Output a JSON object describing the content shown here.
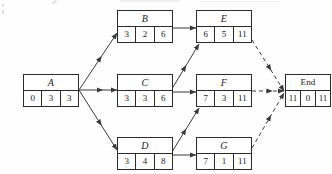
{
  "diagram": {
    "nodes": [
      {
        "id": "A",
        "label": "A",
        "cells": [
          "0",
          "3",
          "3"
        ],
        "x": 23,
        "y": 74,
        "w": 56,
        "h": 33
      },
      {
        "id": "B",
        "label": "B",
        "cells": [
          "3",
          "2",
          "6"
        ],
        "x": 117,
        "y": 10,
        "w": 56,
        "h": 33
      },
      {
        "id": "C",
        "label": "C",
        "cells": [
          "3",
          "3",
          "6"
        ],
        "x": 117,
        "y": 74,
        "w": 56,
        "h": 33
      },
      {
        "id": "D",
        "label": "D",
        "cells": [
          "3",
          "4",
          "8"
        ],
        "x": 117,
        "y": 137,
        "w": 56,
        "h": 33
      },
      {
        "id": "E",
        "label": "E",
        "cells": [
          "6",
          "5",
          "11"
        ],
        "x": 196,
        "y": 10,
        "w": 56,
        "h": 33
      },
      {
        "id": "F",
        "label": "F",
        "cells": [
          "7",
          "3",
          "11"
        ],
        "x": 196,
        "y": 74,
        "w": 56,
        "h": 33
      },
      {
        "id": "G",
        "label": "G",
        "cells": [
          "7",
          "1",
          "11"
        ],
        "x": 196,
        "y": 137,
        "w": 56,
        "h": 33
      },
      {
        "id": "End",
        "label": "End",
        "cells": [
          "11",
          "0",
          "11"
        ],
        "x": 285,
        "y": 74,
        "w": 46,
        "h": 33
      }
    ],
    "edges": [
      {
        "from": "A",
        "to": "B",
        "style": "solid",
        "x1": 79,
        "y1": 90,
        "x2": 117,
        "y2": 33
      },
      {
        "from": "A",
        "to": "C",
        "style": "solid",
        "x1": 79,
        "y1": 90,
        "x2": 117,
        "y2": 90
      },
      {
        "from": "A",
        "to": "D",
        "style": "solid",
        "x1": 79,
        "y1": 90,
        "x2": 117,
        "y2": 150
      },
      {
        "from": "B",
        "to": "E",
        "style": "solid",
        "x1": 173,
        "y1": 28,
        "x2": 196,
        "y2": 28
      },
      {
        "from": "C",
        "to": "E",
        "style": "solid",
        "x1": 167,
        "y1": 97,
        "x2": 199,
        "y2": 44
      },
      {
        "from": "C",
        "to": "F",
        "style": "solid",
        "x1": 173,
        "y1": 92,
        "x2": 196,
        "y2": 92
      },
      {
        "from": "D",
        "to": "F",
        "style": "solid",
        "x1": 167,
        "y1": 160,
        "x2": 199,
        "y2": 108
      },
      {
        "from": "D",
        "to": "G",
        "style": "solid",
        "x1": 173,
        "y1": 155,
        "x2": 196,
        "y2": 155
      },
      {
        "from": "E",
        "to": "End",
        "style": "dashed",
        "x1": 252,
        "y1": 40,
        "x2": 284,
        "y2": 91
      },
      {
        "from": "F",
        "to": "End",
        "style": "dashed",
        "x1": 252,
        "y1": 91,
        "x2": 284,
        "y2": 91
      },
      {
        "from": "G",
        "to": "End",
        "style": "dashed",
        "x1": 252,
        "y1": 148,
        "x2": 284,
        "y2": 93
      }
    ],
    "colors": {
      "stroke": "#2b2b2b",
      "edge": "#3a3a3a",
      "text": "#1b1b1b",
      "background": "#fefefe"
    }
  }
}
